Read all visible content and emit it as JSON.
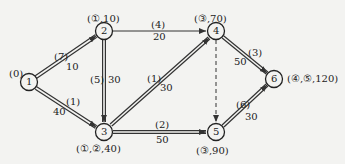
{
  "diagram": {
    "type": "network-shortest-path",
    "colors": {
      "background": "#f3f3f1",
      "stroke": "#333333"
    },
    "nodes": [
      {
        "id": "1",
        "label": "1",
        "mark": "(0)"
      },
      {
        "id": "2",
        "label": "2",
        "mark": "(①,10)"
      },
      {
        "id": "3",
        "label": "3",
        "mark": "(①,②,40)"
      },
      {
        "id": "4",
        "label": "4",
        "mark": "(③,70)"
      },
      {
        "id": "5",
        "label": "5",
        "mark": "(③,90)"
      },
      {
        "id": "6",
        "label": "6",
        "mark": "(④,⑤,120)"
      }
    ],
    "edges": [
      {
        "from": "1",
        "to": "2",
        "order": "(7)",
        "weight": "10",
        "style": "double"
      },
      {
        "from": "1",
        "to": "3",
        "order": "(1)",
        "weight": "40",
        "style": "double"
      },
      {
        "from": "2",
        "to": "4",
        "order": "(4)",
        "weight": "20",
        "style": "single"
      },
      {
        "from": "2",
        "to": "3",
        "order": "(5)",
        "weight": "30",
        "style": "double"
      },
      {
        "from": "3",
        "to": "4",
        "order": "(1)",
        "weight": "30",
        "style": "double"
      },
      {
        "from": "3",
        "to": "5",
        "order": "(2)",
        "weight": "50",
        "style": "double"
      },
      {
        "from": "4",
        "to": "5",
        "order": "",
        "weight": "",
        "style": "dashed"
      },
      {
        "from": "4",
        "to": "6",
        "order": "(3)",
        "weight": "50",
        "style": "double"
      },
      {
        "from": "5",
        "to": "6",
        "order": "(6)",
        "weight": "30",
        "style": "double"
      }
    ]
  }
}
